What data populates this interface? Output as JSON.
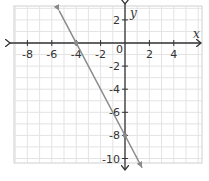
{
  "chart_data": {
    "type": "line",
    "title": "",
    "xlabel": "x",
    "ylabel": "y",
    "xlim": [
      -9.3,
      6.0
    ],
    "ylim": [
      -11,
      3.1
    ],
    "grid": true,
    "grid_step": 1,
    "x_ticks": [
      -8,
      -6,
      -4,
      -2,
      2,
      4
    ],
    "x_tick_labels": [
      "-8",
      "-6",
      "-4",
      "-2",
      "2",
      "4"
    ],
    "y_ticks": [
      2,
      -2,
      -4,
      -6,
      -8,
      -10
    ],
    "y_tick_labels": [
      "2",
      "-2",
      "-4",
      "-6",
      "-8",
      "-10"
    ],
    "origin_label": "0",
    "series": [
      {
        "name": "line",
        "equation": "y = -2x - 8",
        "color": "#8a8a8a",
        "x": [
          -5.4,
          1.4
        ],
        "y": [
          2.8,
          -10.8
        ],
        "arrows": "both"
      }
    ],
    "marked_points": [
      {
        "x": -4,
        "y": 0,
        "label": "x-intercept"
      },
      {
        "x": 0,
        "y": -8,
        "label": "y-intercept"
      }
    ]
  },
  "colors": {
    "grid": "#e3e3e3",
    "axis": "#333333",
    "line": "#8a8a8a",
    "border": "#c8c8c8"
  }
}
